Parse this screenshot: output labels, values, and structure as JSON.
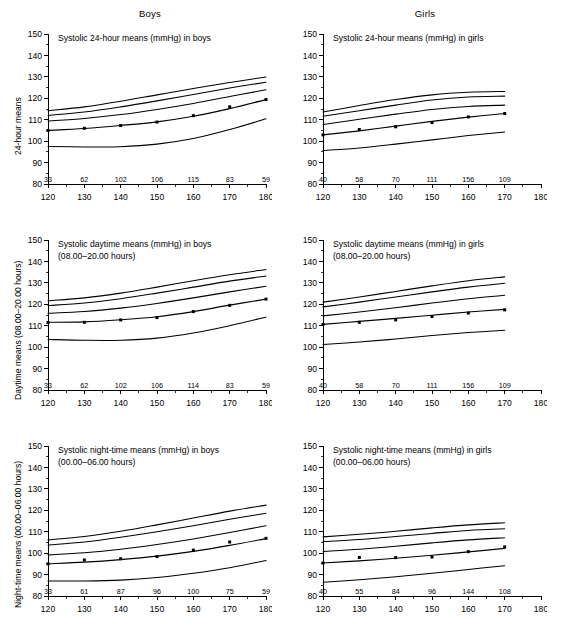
{
  "figure": {
    "column_headers": [
      "Boys",
      "Girls"
    ],
    "x_axis_title": "Height (cm)",
    "y_ticks": [
      80,
      90,
      100,
      110,
      120,
      130,
      140,
      150
    ],
    "y_limits": [
      80,
      150
    ],
    "x_ticks": [
      120,
      130,
      140,
      150,
      160,
      170,
      180
    ],
    "x_limits": [
      120,
      180
    ],
    "row_y_labels": [
      "24-hour means",
      "Daytime means (08.00–20.00 hours)",
      "Night-time means (00.00–06.00 hours)"
    ]
  },
  "chart_data": [
    {
      "type": "line",
      "panel": "boys-24h",
      "title": "Systolic 24-hour means (mmHg) in boys",
      "title_line2": "",
      "xlabel": "Height (cm)",
      "ylabel": "24-hour means",
      "xlim": [
        120,
        180
      ],
      "ylim": [
        80,
        150
      ],
      "grid": false,
      "legend": "none",
      "sample_sizes": [
        33,
        62,
        102,
        106,
        115,
        83,
        59
      ],
      "sample_size_x": [
        120,
        130,
        140,
        150,
        160,
        170,
        180
      ],
      "x": [
        120,
        130,
        140,
        150,
        160,
        170,
        180
      ],
      "series": [
        {
          "name": "P95",
          "values": [
            114.2,
            116.0,
            118.6,
            121.6,
            124.6,
            127.4,
            129.9
          ]
        },
        {
          "name": "P90",
          "values": [
            112.0,
            113.6,
            116.0,
            118.8,
            121.8,
            124.8,
            127.5
          ]
        },
        {
          "name": "P75",
          "values": [
            109.4,
            110.6,
            112.4,
            114.8,
            117.6,
            120.8,
            124.0
          ]
        },
        {
          "name": "P50",
          "values": [
            105.0,
            105.9,
            107.3,
            109.0,
            111.6,
            115.2,
            119.4
          ]
        },
        {
          "name": "P5",
          "values": [
            97.5,
            97.3,
            97.4,
            98.6,
            101.2,
            105.4,
            110.4
          ]
        }
      ],
      "observed_points": {
        "x": [
          120,
          130,
          140,
          150,
          160,
          170,
          180
        ],
        "y": [
          105.0,
          106.0,
          107.3,
          108.9,
          111.9,
          116.0,
          119.4
        ]
      }
    },
    {
      "type": "line",
      "panel": "girls-24h",
      "title": "Systolic 24-hour means (mmHg) in girls",
      "title_line2": "",
      "xlabel": "Height (cm)",
      "ylabel": "24-hour means",
      "xlim": [
        120,
        180
      ],
      "ylim": [
        80,
        150
      ],
      "grid": false,
      "legend": "none",
      "sample_sizes": [
        40,
        58,
        70,
        111,
        156,
        109
      ],
      "sample_size_x": [
        120,
        130,
        140,
        150,
        160,
        170
      ],
      "x": [
        120,
        130,
        140,
        150,
        160,
        170
      ],
      "series": [
        {
          "name": "P95",
          "values": [
            113.6,
            116.6,
            119.4,
            121.6,
            122.8,
            123.2
          ]
        },
        {
          "name": "P90",
          "values": [
            111.6,
            114.2,
            116.8,
            119.2,
            120.6,
            121.0
          ]
        },
        {
          "name": "P75",
          "values": [
            107.8,
            110.2,
            112.6,
            114.8,
            116.2,
            116.8
          ]
        },
        {
          "name": "P50",
          "values": [
            102.9,
            104.8,
            107.0,
            109.2,
            111.2,
            112.9
          ]
        },
        {
          "name": "P5",
          "values": [
            95.6,
            96.8,
            98.6,
            100.6,
            102.6,
            104.3
          ]
        }
      ],
      "observed_points": {
        "x": [
          120,
          130,
          140,
          150,
          160,
          170
        ],
        "y": [
          102.9,
          105.4,
          106.7,
          108.7,
          111.3,
          112.9
        ]
      }
    },
    {
      "type": "line",
      "panel": "boys-daytime",
      "title": "Systolic daytime means (mmHg) in boys",
      "title_line2": "(08.00–20.00 hours)",
      "xlabel": "Height (cm)",
      "ylabel": "Daytime means (08.00–20.00 hours)",
      "xlim": [
        120,
        180
      ],
      "ylim": [
        80,
        150
      ],
      "grid": false,
      "legend": "none",
      "sample_sizes": [
        33,
        62,
        102,
        106,
        114,
        83,
        59
      ],
      "sample_size_x": [
        120,
        130,
        140,
        150,
        160,
        170,
        180
      ],
      "x": [
        120,
        130,
        140,
        150,
        160,
        170,
        180
      ],
      "series": [
        {
          "name": "P95",
          "values": [
            121.6,
            123.0,
            125.2,
            128.0,
            131.0,
            133.8,
            136.2
          ]
        },
        {
          "name": "P90",
          "values": [
            119.4,
            120.6,
            122.6,
            125.2,
            128.0,
            130.8,
            133.2
          ]
        },
        {
          "name": "P75",
          "values": [
            115.8,
            116.6,
            118.2,
            120.4,
            123.0,
            125.8,
            128.4
          ]
        },
        {
          "name": "P50",
          "values": [
            111.6,
            111.8,
            112.8,
            114.2,
            116.6,
            119.6,
            122.4
          ]
        },
        {
          "name": "P5",
          "values": [
            103.6,
            103.2,
            103.2,
            104.2,
            106.6,
            110.0,
            114.0
          ]
        }
      ],
      "observed_points": {
        "x": [
          120,
          130,
          140,
          150,
          160,
          170,
          180
        ],
        "y": [
          111.5,
          111.6,
          112.7,
          113.8,
          116.6,
          119.5,
          122.4
        ]
      }
    },
    {
      "type": "line",
      "panel": "girls-daytime",
      "title": "Systolic daytime means (mmHg) in girls",
      "title_line2": "(08.00–20.00 hours)",
      "xlabel": "Height (cm)",
      "ylabel": "Daytime means (08.00–20.00 hours)",
      "xlim": [
        120,
        180
      ],
      "ylim": [
        80,
        150
      ],
      "grid": false,
      "legend": "none",
      "sample_sizes": [
        40,
        58,
        70,
        111,
        156,
        109
      ],
      "sample_size_x": [
        120,
        130,
        140,
        150,
        160,
        170
      ],
      "x": [
        120,
        130,
        140,
        150,
        160,
        170
      ],
      "series": [
        {
          "name": "P95",
          "values": [
            121.0,
            123.4,
            126.0,
            128.6,
            131.0,
            132.8
          ]
        },
        {
          "name": "P90",
          "values": [
            118.8,
            121.0,
            123.4,
            125.8,
            128.0,
            129.8
          ]
        },
        {
          "name": "P75",
          "values": [
            114.6,
            116.4,
            118.4,
            120.6,
            122.6,
            124.2
          ]
        },
        {
          "name": "P50",
          "values": [
            110.6,
            112.0,
            113.4,
            114.9,
            116.4,
            117.6
          ]
        },
        {
          "name": "P5",
          "values": [
            101.2,
            102.4,
            103.8,
            105.4,
            106.8,
            107.9
          ]
        }
      ],
      "observed_points": {
        "x": [
          120,
          130,
          140,
          150,
          160,
          170
        ],
        "y": [
          110.6,
          111.6,
          112.7,
          114.3,
          115.9,
          117.4
        ]
      }
    },
    {
      "type": "line",
      "panel": "boys-nighttime",
      "title": "Systolic night-time means (mmHg) in boys",
      "title_line2": "(00.00–06.00 hours)",
      "xlabel": "Height (cm)",
      "ylabel": "Night-time means (00.00–06.00 hours)",
      "xlim": [
        120,
        180
      ],
      "ylim": [
        80,
        150
      ],
      "grid": false,
      "legend": "none",
      "sample_sizes": [
        33,
        61,
        87,
        96,
        100,
        75,
        59
      ],
      "sample_size_x": [
        120,
        130,
        140,
        150,
        160,
        170,
        180
      ],
      "x": [
        120,
        130,
        140,
        150,
        160,
        170,
        180
      ],
      "series": [
        {
          "name": "P95",
          "values": [
            106.2,
            107.8,
            110.2,
            113.2,
            116.4,
            119.6,
            122.4
          ]
        },
        {
          "name": "P90",
          "values": [
            103.8,
            105.2,
            107.4,
            110.0,
            112.8,
            115.8,
            118.6
          ]
        },
        {
          "name": "P75",
          "values": [
            99.2,
            100.2,
            101.8,
            104.0,
            106.6,
            109.6,
            112.8
          ]
        },
        {
          "name": "P50",
          "values": [
            95.0,
            95.8,
            97.0,
            98.6,
            100.8,
            103.6,
            106.8
          ]
        },
        {
          "name": "P5",
          "values": [
            87.0,
            87.0,
            87.4,
            88.6,
            90.6,
            93.2,
            96.6
          ]
        }
      ],
      "observed_points": {
        "x": [
          120,
          130,
          140,
          150,
          160,
          170,
          180
        ],
        "y": [
          95.0,
          96.8,
          97.4,
          98.4,
          101.4,
          105.2,
          106.9
        ]
      }
    },
    {
      "type": "line",
      "panel": "girls-nighttime",
      "title": "Systolic night-time means (mmHg) in girls",
      "title_line2": "(00.00–06.00 hours)",
      "xlabel": "Height (cm)",
      "ylabel": "Night-time means (00.00–06.00 hours)",
      "xlim": [
        120,
        180
      ],
      "ylim": [
        80,
        150
      ],
      "grid": false,
      "legend": "none",
      "sample_sizes": [
        40,
        55,
        84,
        96,
        144,
        108
      ],
      "sample_size_x": [
        120,
        130,
        140,
        150,
        160,
        170
      ],
      "x": [
        120,
        130,
        140,
        150,
        160,
        170
      ],
      "series": [
        {
          "name": "P95",
          "values": [
            107.6,
            108.8,
            110.2,
            111.8,
            113.2,
            114.2
          ]
        },
        {
          "name": "P90",
          "values": [
            105.4,
            106.4,
            107.8,
            109.2,
            110.6,
            111.4
          ]
        },
        {
          "name": "P75",
          "values": [
            100.8,
            101.8,
            103.2,
            104.8,
            106.2,
            107.2
          ]
        },
        {
          "name": "P50",
          "values": [
            95.4,
            96.4,
            97.6,
            99.0,
            100.6,
            102.2
          ]
        },
        {
          "name": "P5",
          "values": [
            86.4,
            87.6,
            89.0,
            90.6,
            92.4,
            94.1
          ]
        }
      ],
      "observed_points": {
        "x": [
          120,
          130,
          140,
          150,
          160,
          170
        ],
        "y": [
          95.4,
          98.0,
          97.9,
          98.2,
          100.7,
          102.9
        ]
      }
    }
  ]
}
